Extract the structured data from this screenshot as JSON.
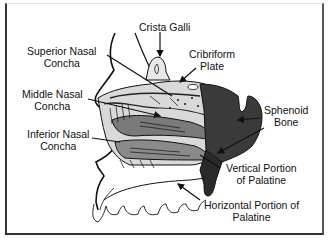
{
  "diagram": {
    "type": "anatomical-illustration",
    "labels": [
      {
        "id": "crista-galli",
        "lines": [
          "Crista Galli"
        ]
      },
      {
        "id": "superior-nasal-concha",
        "lines": [
          "Superior Nasal",
          "Concha"
        ]
      },
      {
        "id": "cribriform-plate",
        "lines": [
          "Cribriform",
          "Plate"
        ]
      },
      {
        "id": "middle-nasal-concha",
        "lines": [
          "Middle Nasal",
          "Concha"
        ]
      },
      {
        "id": "sphenoid-bone",
        "lines": [
          "Sphenoid",
          "Bone"
        ]
      },
      {
        "id": "inferior-nasal-concha",
        "lines": [
          "Inferior Nasal",
          "Concha"
        ]
      },
      {
        "id": "vertical-portion-palatine",
        "lines": [
          "Vertical Portion",
          "of Palatine"
        ]
      },
      {
        "id": "horizontal-portion-palatine",
        "lines": [
          "Horizontal  Portion of",
          "Palatine"
        ]
      }
    ],
    "colors": {
      "ink": "#111111",
      "sphenoid": "#3a3a3a",
      "concha_gray": "#8a8a8a",
      "background": "#ffffff"
    }
  }
}
